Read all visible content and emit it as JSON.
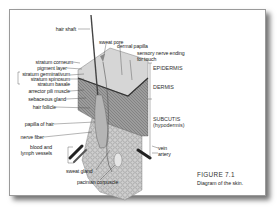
{
  "figure": {
    "title": "FIGURE 7.1",
    "caption": "Diagram of the skin."
  },
  "labels_left": [
    {
      "id": "hair-shaft",
      "text": "hair shaft"
    },
    {
      "id": "stratum-corneum",
      "text": "stratum corneum"
    },
    {
      "id": "pigment-layer",
      "text": "pigment layer"
    },
    {
      "id": "stratum-germinativum",
      "text": "stratum germinativum"
    },
    {
      "id": "stratum-spinosum",
      "text": "stratum spinosum"
    },
    {
      "id": "stratum-basale",
      "text": "stratum basale"
    },
    {
      "id": "arrector-pili-muscle",
      "text": "arrector pili muscle"
    },
    {
      "id": "sebaceous-gland",
      "text": "sebaceous gland"
    },
    {
      "id": "hair-follicle",
      "text": "hair follicle"
    },
    {
      "id": "papilla-of-hair",
      "text": "papilla of hair"
    },
    {
      "id": "nerve-fiber",
      "text": "nerve fiber"
    },
    {
      "id": "blood-vessels-1",
      "text": "blood and"
    },
    {
      "id": "blood-vessels-2",
      "text": "lymph vessels"
    }
  ],
  "labels_top": [
    {
      "id": "sweat-pore",
      "text": "sweat pore"
    },
    {
      "id": "dermal-papilla",
      "text": "dermal papilla"
    },
    {
      "id": "sensory-nerve-1",
      "text": "sensory nerve ending"
    },
    {
      "id": "sensory-nerve-2",
      "text": "for touch"
    }
  ],
  "labels_bottom": [
    {
      "id": "sweat-gland",
      "text": "sweat gland"
    },
    {
      "id": "pacinian-corpuscle",
      "text": "pacinian corpuscle"
    }
  ],
  "labels_right": [
    {
      "id": "vein",
      "text": "vein"
    },
    {
      "id": "artery",
      "text": "artery"
    }
  ],
  "layers": [
    {
      "id": "epidermis",
      "text": "EPIDERMIS"
    },
    {
      "id": "dermis",
      "text": "DERMIS"
    },
    {
      "id": "subcutis-1",
      "text": "SUBCUTIS"
    },
    {
      "id": "subcutis-2",
      "text": "(hypodermis)"
    }
  ],
  "colors": {
    "card_border": "#9a9a9a",
    "text": "#222222",
    "tissue_light": "#d9d9d9",
    "tissue_dark": "#5a5a5a"
  }
}
